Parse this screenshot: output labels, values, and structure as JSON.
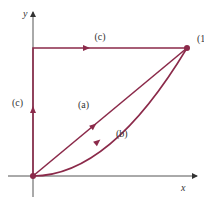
{
  "diagram": {
    "title": "",
    "colors": {
      "path": "#8b2a4a",
      "axis": "#555555"
    },
    "axes": {
      "x_label": "x",
      "y_label": "y"
    },
    "point_label": "(1, 1)",
    "paths": [
      {
        "id": "a",
        "label": "(a)",
        "description": "straight line from origin to (1,1)"
      },
      {
        "id": "b",
        "label": "(b)",
        "description": "curve y = x^2 from origin to (1,1)"
      },
      {
        "id": "c_vertical",
        "label": "(c)",
        "description": "vertical segment from origin to (0,1)"
      },
      {
        "id": "c_horizontal",
        "label": "(c)",
        "description": "horizontal segment from (0,1) to (1,1)"
      }
    ]
  }
}
